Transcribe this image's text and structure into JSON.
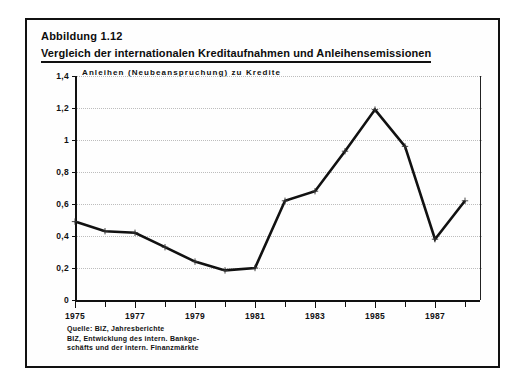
{
  "figure": {
    "number": "Abbildung 1.12",
    "title": "Vergleich der internationalen Kreditaufnahmen und Anleihensemissionen",
    "subtitle": "Anleihen (Neubeanspruchung) zu Kredite",
    "source_lines": [
      "Quelle: BIZ, Jahresberichte",
      "BIZ, Entwicklung des intern. Bankge-",
      "schäfts und der intern. Finanzmärkte"
    ],
    "line_color": "#111111",
    "frame_color": "#111111"
  },
  "chart_data": {
    "type": "line",
    "title": "Vergleich der internationalen Kreditaufnahmen und Anleihensemissionen",
    "subtitle": "Anleihen (Neubeanspruchung) zu Kredite",
    "xlabel": "",
    "ylabel": "",
    "grid": true,
    "legend_position": "none",
    "x": [
      1975,
      1976,
      1977,
      1978,
      1979,
      1980,
      1981,
      1982,
      1983,
      1984,
      1985,
      1986,
      1987,
      1988
    ],
    "xlim": [
      1975,
      1988.5
    ],
    "xtick_labels": [
      "1975",
      "1977",
      "1979",
      "1981",
      "1983",
      "1985",
      "1987"
    ],
    "xtick_values": [
      1975,
      1977,
      1979,
      1981,
      1983,
      1985,
      1987
    ],
    "ylim": [
      0,
      1.4
    ],
    "ytick_values": [
      0,
      0.2,
      0.4,
      0.6,
      0.8,
      1,
      1.2,
      1.4
    ],
    "ytick_labels": [
      "0",
      "0,2",
      "0,4",
      "0,6",
      "0,8",
      "1",
      "1,2",
      "1,4"
    ],
    "series": [
      {
        "name": "Anleihen (Neubeanspruchung) zu Kredite",
        "values": [
          0.49,
          0.43,
          0.42,
          0.33,
          0.24,
          0.185,
          0.2,
          0.62,
          0.68,
          0.93,
          1.19,
          0.96,
          0.38,
          0.62
        ]
      }
    ]
  }
}
